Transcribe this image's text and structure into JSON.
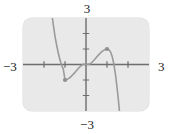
{
  "figure": {
    "kind": "coordinate-graph",
    "background_color": "#ffffff",
    "plot_background_color": "#e9e9e9",
    "axis_color": "#6e6e6e",
    "curve_color": "#9a9a9a",
    "point_color": "#8f8f8f",
    "label_color": "#1a1a1a"
  },
  "labels": {
    "top": "3",
    "bottom": "−3",
    "left": "−3",
    "right": "3"
  },
  "chart_data": {
    "type": "line",
    "title": "",
    "xlabel": "",
    "ylabel": "",
    "xlim": [
      -3,
      3
    ],
    "ylim": [
      -3,
      3
    ],
    "grid": false,
    "legend": "none",
    "xticks": [
      -2,
      -1,
      1,
      2
    ],
    "yticks": [
      -2,
      -1,
      1,
      2
    ],
    "xtick_labels": [
      "",
      "",
      "",
      ""
    ],
    "ytick_labels": [
      "",
      "",
      "",
      ""
    ],
    "axis_end_labels": {
      "x_min": "−3",
      "x_max": "3",
      "y_min": "−3",
      "y_max": "3"
    },
    "series": [
      {
        "name": "curve",
        "description": "cubic-like curve, falls steeply from upper left, local minimum near (-1,-1), rises through the origin, local maximum near (1,1), then falls steeply off the lower right",
        "x": [
          -1.62,
          -1.55,
          -1.48,
          -1.4,
          -1.32,
          -1.24,
          -1.16,
          -1.08,
          -1.0,
          -0.9,
          -0.8,
          -0.7,
          -0.6,
          -0.5,
          -0.4,
          -0.3,
          -0.2,
          -0.1,
          0.0,
          0.1,
          0.2,
          0.3,
          0.4,
          0.5,
          0.6,
          0.7,
          0.8,
          0.9,
          1.0,
          1.08,
          1.16,
          1.24,
          1.32,
          1.4,
          1.48,
          1.55,
          1.62
        ],
        "y": [
          3.2,
          2.5,
          1.85,
          1.26,
          0.74,
          0.3,
          -0.05,
          -0.3,
          -1.0,
          -0.96,
          -0.88,
          -0.76,
          -0.62,
          -0.47,
          -0.31,
          -0.16,
          -0.04,
          0.02,
          0.0,
          0.02,
          0.04,
          0.16,
          0.31,
          0.47,
          0.62,
          0.76,
          0.88,
          0.96,
          1.0,
          0.97,
          0.84,
          0.55,
          0.08,
          -0.6,
          -1.5,
          -2.4,
          -3.4
        ]
      }
    ],
    "points": [
      {
        "name": "local-minimum",
        "x": -1.0,
        "y": -1.0
      },
      {
        "name": "local-maximum",
        "x": 1.0,
        "y": 1.0
      }
    ]
  }
}
